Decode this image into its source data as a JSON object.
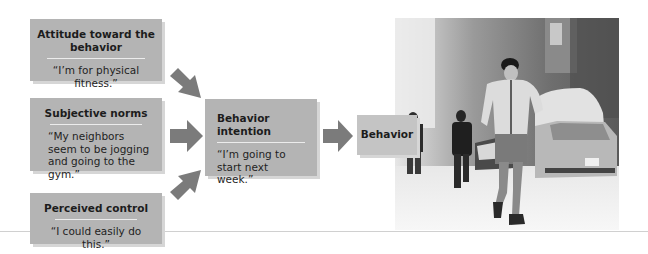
{
  "diagram": {
    "type": "theory-of-planned-behavior",
    "inputs": [
      {
        "title": "Attitude toward the behavior",
        "quote": "“I’m for physical fitness.”"
      },
      {
        "title": "Subjective norms",
        "quote": "“My neighbors seem to be jogging and going to the gym.”"
      },
      {
        "title": "Perceived control",
        "quote": "“I could easily do this.”"
      }
    ],
    "intention": {
      "title": "Behavior intention",
      "quote": "“I’m going to start next week.”"
    },
    "outcome": {
      "title": "Behavior"
    },
    "photo": {
      "description": "man jogging on snowy street with parked snow-covered cars and pedestrians"
    }
  },
  "colors": {
    "box_fill": "#b4b4b4",
    "box_shadow": "#d6d6d6",
    "arrow": "#7b7b7b",
    "rule": "#ececec",
    "outcome_fill": "#c4c4c4"
  }
}
